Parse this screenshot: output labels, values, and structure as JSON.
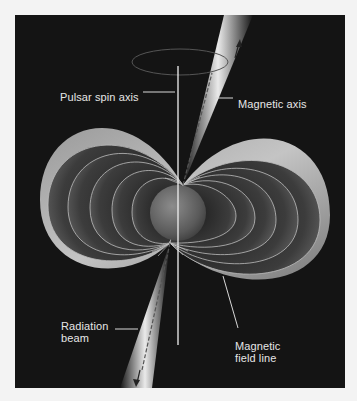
{
  "figure": {
    "colors": {
      "page_background": "#f3f3f3",
      "panel_background": "#141414",
      "label_text": "#e6e6e6",
      "envelope": "#b8b8b8",
      "star": "#6e6e6e",
      "beam": "#f5f5f5"
    },
    "labels": {
      "spin_axis": "Pulsar spin axis",
      "magnetic_axis": "Magnetic axis",
      "radiation_beam": "Radiation\nbeam",
      "field_line": "Magnetic\nfield line"
    }
  }
}
